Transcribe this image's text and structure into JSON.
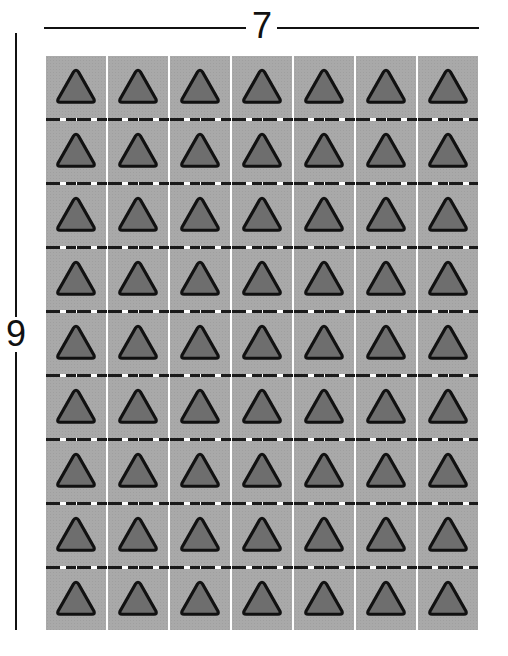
{
  "dimensions": {
    "width_label": "7",
    "height_label": "9"
  },
  "grid": {
    "columns": 7,
    "rows": 9,
    "tile_shape": "triangle-icon",
    "colors": {
      "tile_fill": "#a9a9a9",
      "triangle_fill": "#6e6e6e",
      "triangle_outline": "#111111",
      "gap": "#ffffff",
      "divider_dash": "#1a1a1a"
    }
  }
}
